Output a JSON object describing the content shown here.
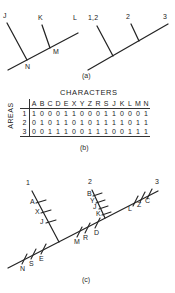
{
  "figure": {
    "panels": [
      {
        "id": "a",
        "caption": "(a)"
      },
      {
        "id": "b",
        "caption": "(b)"
      },
      {
        "id": "c",
        "caption": "(c)"
      }
    ]
  },
  "panel_a": {
    "left_tree": {
      "tip_labels": [
        "J",
        "K",
        "L"
      ],
      "node_labels": [
        "N",
        "M"
      ]
    },
    "right_tree": {
      "tip_labels": [
        "1,2",
        "2",
        "3"
      ]
    }
  },
  "panel_b": {
    "columns_title": "CHARACTERS",
    "rows_title": "AREAS",
    "corner": "",
    "characters": [
      "A",
      "B",
      "C",
      "D",
      "E",
      "X",
      "Y",
      "Z",
      "R",
      "S",
      "J",
      "K",
      "L",
      "M",
      "N"
    ],
    "areas": [
      "1",
      "2",
      "3"
    ],
    "matrix": [
      [
        "1",
        "0",
        "0",
        "0",
        "1",
        "1",
        "0",
        "0",
        "0",
        "1",
        "1",
        "0",
        "0",
        "0",
        "1"
      ],
      [
        "0",
        "1",
        "0",
        "1",
        "1",
        "0",
        "1",
        "0",
        "1",
        "1",
        "1",
        "1",
        "0",
        "1",
        "1"
      ],
      [
        "0",
        "0",
        "1",
        "1",
        "1",
        "0",
        "0",
        "1",
        "1",
        "1",
        "0",
        "0",
        "1",
        "1",
        "1"
      ]
    ]
  },
  "panel_c": {
    "terminal_labels": [
      "1",
      "2",
      "3"
    ],
    "branch_1_ticks": [
      "A",
      "X",
      "J"
    ],
    "branch_2_ticks": [
      "B",
      "Y",
      "J",
      "K"
    ],
    "branch_3_ticks": [
      "L",
      "Z",
      "C"
    ],
    "stem_ticks": [
      "M",
      "R",
      "D"
    ],
    "basal_ticks": [
      "N",
      "S",
      "E"
    ]
  },
  "style": {
    "line_color": "#242424",
    "text_color": "#232323",
    "background": "#ffffff"
  }
}
